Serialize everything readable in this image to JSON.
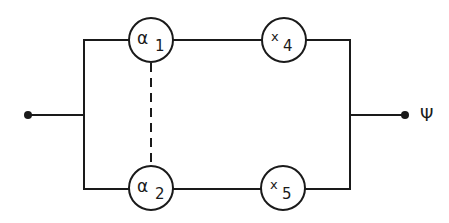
{
  "diagram": {
    "type": "parallel-series network",
    "colors": {
      "line": "#1a1a1a",
      "background": "#ffffff"
    },
    "input_terminal": {
      "label": ""
    },
    "output_terminal": {
      "label": "Ψ"
    },
    "branches": [
      {
        "name": "upper",
        "nodes": [
          {
            "symbol": "α",
            "subscript": "1"
          },
          {
            "symbol": "x",
            "subscript": "4"
          }
        ]
      },
      {
        "name": "lower",
        "nodes": [
          {
            "symbol": "α",
            "subscript": "2"
          },
          {
            "symbol": "x",
            "subscript": "5"
          }
        ]
      }
    ],
    "coupling": {
      "from": "α1",
      "to": "α2",
      "style": "dashed"
    }
  }
}
